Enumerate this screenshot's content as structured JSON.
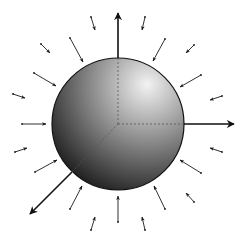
{
  "diagram": {
    "title": "",
    "canvas": {
      "width": 244,
      "height": 242,
      "background": "#ffffff"
    },
    "sphere": {
      "cx": 118,
      "cy": 124,
      "r": 66,
      "highlight_color": "#f2f2f2",
      "mid_color": "#8a8a8a",
      "shadow_color": "#0a0a0a",
      "outline_color": "#111111"
    },
    "axes": [
      {
        "name": "z-axis",
        "x1": 118,
        "y1": 58,
        "x2": 118,
        "y2": 13,
        "hidden_dashed_from": [
          118,
          124
        ]
      },
      {
        "name": "y-axis",
        "x1": 184,
        "y1": 124,
        "x2": 234,
        "y2": 124,
        "hidden_dashed_from": [
          118,
          124
        ]
      },
      {
        "name": "x-axis",
        "x1": 72,
        "y1": 172,
        "x2": 30,
        "y2": 214,
        "hidden_dashed_from": [
          118,
          124
        ]
      }
    ],
    "field_arrows": [
      {
        "x1": 91,
        "y1": 17,
        "x2": 95,
        "y2": 30
      },
      {
        "x1": 70,
        "y1": 38,
        "x2": 83,
        "y2": 62
      },
      {
        "x1": 41,
        "y1": 44,
        "x2": 50,
        "y2": 53
      },
      {
        "x1": 34,
        "y1": 73,
        "x2": 56,
        "y2": 86
      },
      {
        "x1": 13,
        "y1": 94,
        "x2": 25,
        "y2": 98
      },
      {
        "x1": 22,
        "y1": 124,
        "x2": 46,
        "y2": 124
      },
      {
        "x1": 15,
        "y1": 152,
        "x2": 27,
        "y2": 148
      },
      {
        "x1": 35,
        "y1": 172,
        "x2": 57,
        "y2": 160
      },
      {
        "x1": 70,
        "y1": 209,
        "x2": 82,
        "y2": 186
      },
      {
        "x1": 91,
        "y1": 230,
        "x2": 95,
        "y2": 217
      },
      {
        "x1": 118,
        "y1": 222,
        "x2": 118,
        "y2": 196
      },
      {
        "x1": 145,
        "y1": 230,
        "x2": 142,
        "y2": 217
      },
      {
        "x1": 165,
        "y1": 209,
        "x2": 154,
        "y2": 186
      },
      {
        "x1": 194,
        "y1": 202,
        "x2": 186,
        "y2": 193
      },
      {
        "x1": 201,
        "y1": 173,
        "x2": 180,
        "y2": 160
      },
      {
        "x1": 222,
        "y1": 152,
        "x2": 210,
        "y2": 148
      },
      {
        "x1": 222,
        "y1": 96,
        "x2": 210,
        "y2": 100
      },
      {
        "x1": 201,
        "y1": 75,
        "x2": 180,
        "y2": 87
      },
      {
        "x1": 194,
        "y1": 45,
        "x2": 186,
        "y2": 53
      },
      {
        "x1": 165,
        "y1": 39,
        "x2": 153,
        "y2": 61
      },
      {
        "x1": 145,
        "y1": 17,
        "x2": 142,
        "y2": 30
      }
    ],
    "arrow_color": "#1a1a1a"
  }
}
